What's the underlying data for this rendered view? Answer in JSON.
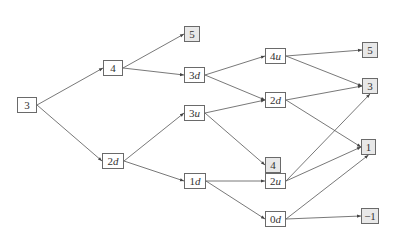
{
  "diagram": {
    "type": "tree",
    "colors": {
      "edge": "#555555",
      "border": "#6a6a6a",
      "leaf_fill": "#e8e8e8",
      "node_fill": "#ffffff"
    },
    "nodes": [
      {
        "id": "n0",
        "num": "3",
        "var": "",
        "x": 17,
        "y": 97,
        "w": 20,
        "leaf": false
      },
      {
        "id": "n1",
        "num": "4",
        "var": "",
        "x": 103,
        "y": 60,
        "w": 20,
        "leaf": false
      },
      {
        "id": "n2",
        "num": "2",
        "var": "d",
        "x": 102,
        "y": 153,
        "w": 22,
        "leaf": false
      },
      {
        "id": "n3",
        "num": "5",
        "var": "",
        "x": 184,
        "y": 26,
        "w": 16,
        "leaf": true
      },
      {
        "id": "n4",
        "num": "3",
        "var": "d",
        "x": 184,
        "y": 67,
        "w": 21,
        "leaf": false
      },
      {
        "id": "n5",
        "num": "3",
        "var": "u",
        "x": 184,
        "y": 105,
        "w": 21,
        "leaf": false
      },
      {
        "id": "n6",
        "num": "1",
        "var": "d",
        "x": 184,
        "y": 173,
        "w": 22,
        "leaf": false
      },
      {
        "id": "n7",
        "num": "4",
        "var": "u",
        "x": 265,
        "y": 48,
        "w": 21,
        "leaf": false
      },
      {
        "id": "n8",
        "num": "2",
        "var": "d",
        "x": 265,
        "y": 92,
        "w": 21,
        "leaf": false
      },
      {
        "id": "n9",
        "num": "4",
        "var": "",
        "x": 265,
        "y": 157,
        "w": 16,
        "leaf": true
      },
      {
        "id": "n10",
        "num": "2",
        "var": "u",
        "x": 265,
        "y": 173,
        "w": 21,
        "leaf": false
      },
      {
        "id": "n11",
        "num": "0",
        "var": "d",
        "x": 265,
        "y": 211,
        "w": 21,
        "leaf": false
      },
      {
        "id": "n12",
        "num": "5",
        "var": "",
        "x": 362,
        "y": 42,
        "w": 16,
        "leaf": true
      },
      {
        "id": "n13",
        "num": "3",
        "var": "",
        "x": 362,
        "y": 78,
        "w": 16,
        "leaf": true
      },
      {
        "id": "n14",
        "num": "1",
        "var": "",
        "x": 361,
        "y": 139,
        "w": 15,
        "leaf": true
      },
      {
        "id": "n15",
        "num": "−1",
        "var": "",
        "x": 361,
        "y": 208,
        "w": 18,
        "leaf": true
      }
    ],
    "edges": [
      [
        "n0",
        "n1"
      ],
      [
        "n0",
        "n2"
      ],
      [
        "n1",
        "n3"
      ],
      [
        "n1",
        "n4"
      ],
      [
        "n2",
        "n5"
      ],
      [
        "n2",
        "n6"
      ],
      [
        "n4",
        "n7"
      ],
      [
        "n4",
        "n8"
      ],
      [
        "n5",
        "n8"
      ],
      [
        "n5",
        "n9"
      ],
      [
        "n6",
        "n10"
      ],
      [
        "n6",
        "n11"
      ],
      [
        "n7",
        "n12"
      ],
      [
        "n7",
        "n13"
      ],
      [
        "n8",
        "n13"
      ],
      [
        "n8",
        "n14"
      ],
      [
        "n10",
        "n13"
      ],
      [
        "n10",
        "n14"
      ],
      [
        "n11",
        "n14"
      ],
      [
        "n11",
        "n15"
      ]
    ]
  }
}
